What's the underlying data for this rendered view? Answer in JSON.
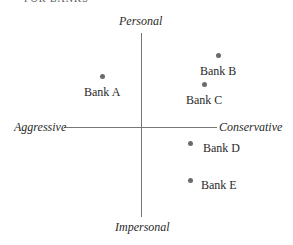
{
  "caption": "FOR BANKS",
  "axes": {
    "top": "Personal",
    "bottom": "Impersonal",
    "left": "Aggressive",
    "right": "Conservative"
  },
  "banks": [
    {
      "label": "Bank A"
    },
    {
      "label": "Bank B"
    },
    {
      "label": "Bank C"
    },
    {
      "label": "Bank D"
    },
    {
      "label": "Bank E"
    }
  ]
}
